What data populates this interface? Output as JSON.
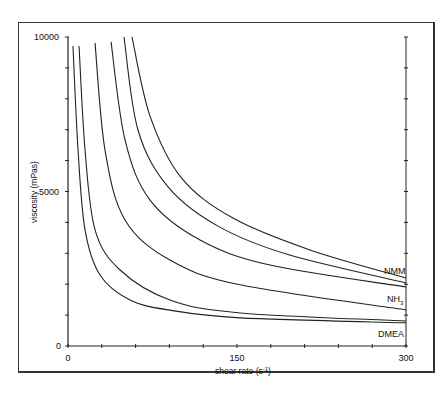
{
  "chart_data": {
    "type": "line",
    "title": "",
    "xlabel": "shear rate (s⁻¹)",
    "ylabel": "viscosity (mPas)",
    "xlim": [
      0,
      300
    ],
    "ylim": [
      0,
      10000
    ],
    "x_ticks": [
      0,
      150,
      300
    ],
    "y_ticks": [
      0,
      5000,
      10000
    ],
    "x_minor_tick_step": 30,
    "y_minor_tick_step": 1000,
    "grid": false,
    "legend": "inline labels at right edge",
    "series": [
      {
        "name": "DMEA (a)",
        "label_group": "DMEA",
        "x": [
          4.4,
          8.9,
          15.1,
          28.4,
          55.0,
          90.5,
          152.7,
          300
        ],
        "y": [
          9710,
          6350,
          3760,
          2300,
          1490,
          1160,
          910,
          750
        ]
      },
      {
        "name": "DMEA (b)",
        "label_group": "DMEA",
        "x": [
          9.8,
          15.1,
          24.0,
          46.2,
          90.5,
          152.7,
          300
        ],
        "y": [
          9710,
          6350,
          3760,
          2460,
          1490,
          1070,
          810
        ]
      },
      {
        "name": "NH3 (a)",
        "label_group": "NH3",
        "x": [
          24.0,
          32.8,
          50.6,
          90.5,
          152.7,
          300
        ],
        "y": [
          9810,
          6350,
          4080,
          2780,
          1980,
          1170
        ]
      },
      {
        "name": "NH3 (b)",
        "label_group": "NH3",
        "x": [
          38.2,
          50.6,
          72.8,
          117.2,
          179.3,
          300
        ],
        "y": [
          9840,
          6670,
          4720,
          3430,
          2620,
          1910
        ]
      },
      {
        "name": "NMM (a)",
        "label_group": "NMM",
        "x": [
          49.7,
          62.1,
          88.8,
          133.1,
          196.1,
          300
        ],
        "y": [
          10000,
          6990,
          5150,
          3880,
          2950,
          2040
        ]
      },
      {
        "name": "NMM (b)",
        "label_group": "NMM",
        "x": [
          56.8,
          72.8,
          100.7,
          146.4,
          214.7,
          300
        ],
        "y": [
          10000,
          7440,
          5440,
          4140,
          3110,
          2200
        ]
      }
    ],
    "annotations": [
      "NMM",
      "NH3",
      "DMEA"
    ]
  },
  "labels": {
    "y_top": "10000",
    "y_mid": "5000",
    "y_zero": "0",
    "x_zero": "0",
    "x_mid": "150",
    "x_max": "300",
    "ylabel": "viscosity (mPas)",
    "xlabel_main": "shear rate (s",
    "xlabel_sup": "-1",
    "xlabel_end": ")",
    "nmm": "NMM",
    "nh3_main": "NH",
    "nh3_sub": "3",
    "dmea": "DMEA"
  }
}
